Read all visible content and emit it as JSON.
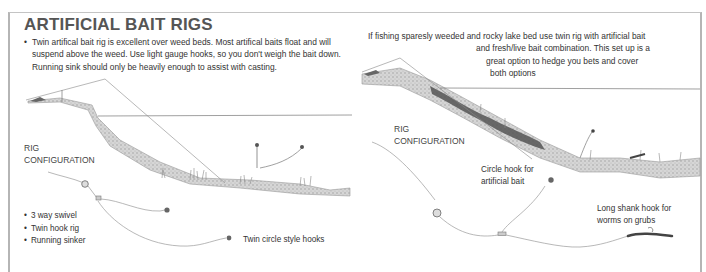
{
  "title": "ARTIFICIAL BAIT RIGS",
  "left_panel": {
    "description": "Twin artifical bait rig is excellent over weed beds. Most artifical baits float and will suspend above the weed. Use light gauge hooks, so you don't weigh the bait down. Running sink should only be heavily enough to assist with casting.",
    "rig_label_line1": "RIG",
    "rig_label_line2": "CONFIGURATION",
    "components": [
      "3 way swivel",
      "Twin hook rig",
      "Running sinker"
    ],
    "hooks_annotation": "Twin circle style hooks"
  },
  "right_panel": {
    "description_lines": [
      "If fishing sparesly weeded and rocky lake bed use twin rig with artificial bait",
      "and fresh/live bait combination. This set up is a",
      "great option to hedge you bets and cover",
      "both options"
    ],
    "rig_label_line1": "RIG",
    "rig_label_line2": "CONFIGURATION",
    "circle_hook_annotation_line1": "Circle hook for",
    "circle_hook_annotation_line2": "artificial bait",
    "long_shank_annotation_line1": "Long shank hook for",
    "long_shank_annotation_line2": "worms on grubs"
  },
  "colors": {
    "border": "#b5b5b5",
    "text": "#333333",
    "title": "#555555",
    "lakebed": "#a8a8a8",
    "rock": "#4a4a4a"
  }
}
